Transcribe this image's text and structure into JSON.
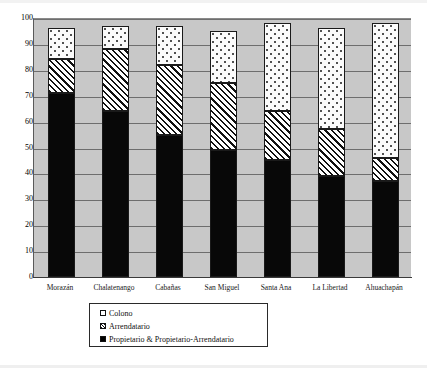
{
  "chart_data": {
    "type": "bar",
    "subtype": "stacked-bar-percent",
    "title": "",
    "xlabel": "",
    "ylabel": "",
    "ylim": [
      0,
      100
    ],
    "yticks": [
      0,
      10,
      20,
      30,
      40,
      50,
      60,
      70,
      80,
      90,
      100
    ],
    "ytick_labels": [
      "0",
      "10",
      "20",
      "30",
      "40",
      "50",
      "60",
      "70",
      "80",
      "90",
      "100"
    ],
    "grid": true,
    "grid_axis": "y",
    "legend_position": "below-axes-center",
    "categories": [
      "Morazán",
      "Chalatenango",
      "Cabañas",
      "San Miguel",
      "Santa Ana",
      "La Libertad",
      "Ahuachapán"
    ],
    "series": [
      {
        "name": "Propietario & Propietario-Arrendatario",
        "pattern": "solid-black",
        "color": "#000000",
        "values": [
          71,
          64,
          55,
          49,
          45,
          39,
          37
        ]
      },
      {
        "name": "Arrendatario",
        "pattern": "diagonal-hatch",
        "color": "#ffffff",
        "values": [
          13,
          24,
          27,
          26,
          19,
          18,
          9
        ]
      },
      {
        "name": "Colono",
        "pattern": "dotted",
        "color": "#ffffff",
        "values": [
          12,
          9,
          15,
          20,
          34,
          39,
          52
        ]
      }
    ],
    "cumulative_tops": [
      {
        "category": "Morazán",
        "owner": 71,
        "renter": 84,
        "colono": 96
      },
      {
        "category": "Chalatenango",
        "owner": 64,
        "renter": 88,
        "colono": 97
      },
      {
        "category": "Cabañas",
        "owner": 55,
        "renter": 82,
        "colono": 97
      },
      {
        "category": "San Miguel",
        "owner": 49,
        "renter": 75,
        "colono": 95
      },
      {
        "category": "Santa Ana",
        "owner": 45,
        "renter": 64,
        "colono": 98
      },
      {
        "category": "La Libertad",
        "owner": 39,
        "renter": 57,
        "colono": 96
      },
      {
        "category": "Ahuachapán",
        "owner": 37,
        "renter": 46,
        "colono": 98
      }
    ]
  },
  "legend": {
    "items": [
      {
        "label": "Colono",
        "swatch": "dotted-square-icon"
      },
      {
        "label": "Arrendatario",
        "swatch": "hatched-square-icon"
      },
      {
        "label": "Propietario & Propietario-Arrendatario",
        "swatch": "black-square-icon"
      }
    ]
  },
  "colors": {
    "plot_background": "#c8c8c8",
    "page_background": "#ffffff",
    "gridline": "#6e6e6e",
    "axis": "#3a3a3a",
    "series_owner": "#000000",
    "series_renter": "#ffffff",
    "series_colono": "#ffffff"
  }
}
